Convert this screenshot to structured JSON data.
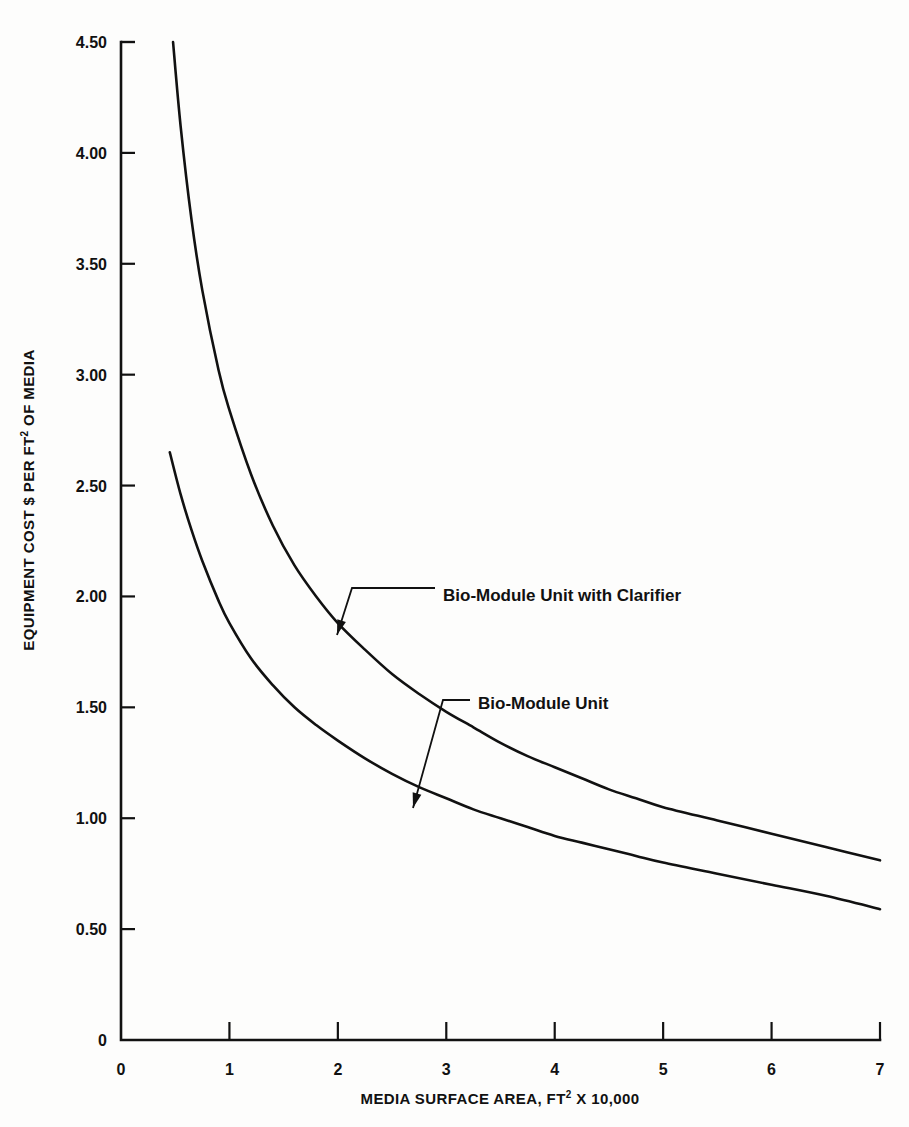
{
  "chart_data": {
    "type": "line",
    "title": "",
    "subtitle": "",
    "xlabel": "MEDIA SURFACE AREA, FT² X 10,000",
    "ylabel": "EQUIPMENT COST $ PER FT² OF MEDIA",
    "xlim": [
      0,
      7
    ],
    "ylim": [
      0,
      4.5
    ],
    "xticks": [
      "0",
      "1",
      "2",
      "3",
      "4",
      "5",
      "6",
      "7"
    ],
    "xtick_values": [
      0,
      1,
      2,
      3,
      4,
      5,
      6,
      7
    ],
    "yticks": [
      "0",
      "0.50",
      "1.00",
      "1.50",
      "2.00",
      "2.50",
      "3.00",
      "3.50",
      "4.00",
      "4.50"
    ],
    "ytick_values": [
      0,
      0.5,
      1.0,
      1.5,
      2.0,
      2.5,
      3.0,
      3.5,
      4.0,
      4.5
    ],
    "grid": false,
    "legend_position": "inline-annotations",
    "series": [
      {
        "name": "Bio-Module Unit with Clarifier",
        "x": [
          0.48,
          0.55,
          0.65,
          0.75,
          0.9,
          1.0,
          1.2,
          1.4,
          1.6,
          1.8,
          2.0,
          2.25,
          2.5,
          2.75,
          3.0,
          3.25,
          3.5,
          3.75,
          4.0,
          4.25,
          4.5,
          4.75,
          5.0,
          5.5,
          6.0,
          6.5,
          7.0
        ],
        "values": [
          4.5,
          4.12,
          3.7,
          3.38,
          3.02,
          2.84,
          2.55,
          2.32,
          2.14,
          2.0,
          1.88,
          1.76,
          1.65,
          1.56,
          1.48,
          1.41,
          1.34,
          1.28,
          1.23,
          1.18,
          1.13,
          1.09,
          1.05,
          0.99,
          0.93,
          0.87,
          0.81
        ]
      },
      {
        "name": "Bio-Module Unit",
        "x": [
          0.45,
          0.55,
          0.65,
          0.75,
          0.9,
          1.0,
          1.2,
          1.4,
          1.6,
          1.8,
          2.0,
          2.25,
          2.5,
          2.75,
          3.0,
          3.25,
          3.5,
          3.75,
          4.0,
          4.25,
          4.5,
          4.75,
          5.0,
          5.5,
          6.0,
          6.5,
          7.0
        ],
        "values": [
          2.65,
          2.46,
          2.3,
          2.16,
          1.98,
          1.88,
          1.72,
          1.6,
          1.5,
          1.42,
          1.35,
          1.27,
          1.2,
          1.14,
          1.09,
          1.04,
          1.0,
          0.96,
          0.92,
          0.89,
          0.86,
          0.83,
          0.8,
          0.75,
          0.7,
          0.65,
          0.59
        ]
      }
    ],
    "annotations": [
      {
        "text": "Bio-Module Unit with Clarifier",
        "label_x": 443,
        "label_y": 601,
        "leader_from_x": 352,
        "leader_from_y": 588,
        "leader_mid_x": 435,
        "leader_mid_y": 588,
        "arrow_x": 337,
        "arrow_y": 635
      },
      {
        "text": "Bio-Module Unit",
        "label_x": 478,
        "label_y": 709,
        "leader_from_x": 443,
        "leader_from_y": 700,
        "leader_mid_x": 470,
        "leader_mid_y": 700,
        "arrow_x": 413,
        "arrow_y": 808
      }
    ]
  },
  "axes": {
    "x_label_parts": {
      "pre": "MEDIA SURFACE AREA, FT",
      "sup": "2",
      "post": " X 10,000"
    },
    "y_label_parts": {
      "pre": "EQUIPMENT COST $ PER FT",
      "sup": "2",
      "post": " OF MEDIA"
    }
  },
  "colors": {
    "ink": "#111111",
    "paper": "#fdfdfc"
  }
}
